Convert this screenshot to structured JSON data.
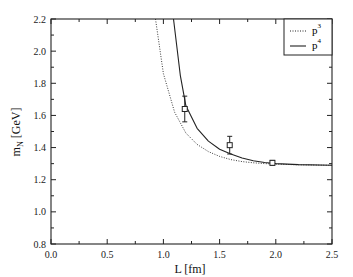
{
  "chart_data": {
    "type": "line",
    "title": "",
    "xlabel": "L [fm]",
    "ylabel": "m_N [GeV]",
    "xlim": [
      0.0,
      2.5
    ],
    "ylim": [
      0.8,
      2.2
    ],
    "x_ticks": [
      "0.0",
      "0.5",
      "1.0",
      "1.5",
      "2.0",
      "2.5"
    ],
    "y_ticks": [
      "0.8",
      "1.0",
      "1.2",
      "1.4",
      "1.6",
      "1.8",
      "2.0",
      "2.2"
    ],
    "grid": false,
    "legend_position": "upper right",
    "legend": [
      {
        "label": "p",
        "sup": "3",
        "style": "dotted"
      },
      {
        "label": "p",
        "sup": "4",
        "style": "solid"
      }
    ],
    "series": [
      {
        "name": "p^3",
        "style": "dotted",
        "x": [
          0.93,
          1.0,
          1.1,
          1.2,
          1.3,
          1.4,
          1.5,
          1.6,
          1.7,
          1.8,
          1.9,
          2.0,
          2.2,
          2.5
        ],
        "y": [
          2.2,
          1.86,
          1.62,
          1.49,
          1.42,
          1.375,
          1.345,
          1.325,
          1.313,
          1.305,
          1.3,
          1.297,
          1.293,
          1.29
        ]
      },
      {
        "name": "p^4",
        "style": "solid",
        "x": [
          1.09,
          1.15,
          1.2,
          1.3,
          1.4,
          1.5,
          1.6,
          1.7,
          1.8,
          1.9,
          2.0,
          2.2,
          2.5
        ],
        "y": [
          2.2,
          1.85,
          1.66,
          1.52,
          1.44,
          1.39,
          1.36,
          1.335,
          1.318,
          1.307,
          1.3,
          1.294,
          1.29
        ]
      },
      {
        "name": "lattice data",
        "style": "markers",
        "marker": "open-square",
        "x": [
          1.19,
          1.59,
          1.97
        ],
        "y": [
          1.64,
          1.415,
          1.305
        ],
        "yerr": [
          0.08,
          0.055,
          0.015
        ]
      }
    ]
  }
}
